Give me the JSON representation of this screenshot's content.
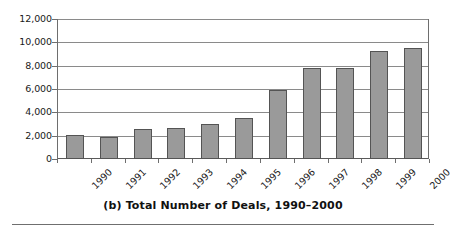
{
  "caption": "(b) Total Number of Deals, 1990–2000",
  "colors": {
    "bar_fill": "#9a9a9a",
    "bar_border": "#545454",
    "gridline": "#8a8a8a",
    "axis": "#6e6e6e",
    "text": "#1a1a1a"
  },
  "axis": {
    "y_ticks": [
      "0",
      "2,000",
      "4,000",
      "6,000",
      "8,000",
      "10,000",
      "12,000"
    ]
  },
  "chart_data": {
    "type": "bar",
    "title": "(b) Total Number of Deals, 1990–2000",
    "xlabel": "",
    "ylabel": "",
    "ylim": [
      0,
      12000
    ],
    "ytick_values": [
      0,
      2000,
      4000,
      6000,
      8000,
      10000,
      12000
    ],
    "ytick_labels": [
      "0",
      "2,000",
      "4,000",
      "6,000",
      "8,000",
      "10,000",
      "12,000"
    ],
    "grid": true,
    "legend": false,
    "categories": [
      "1990",
      "1991",
      "1992",
      "1993",
      "1994",
      "1995",
      "1996",
      "1997",
      "1998",
      "1999",
      "2000"
    ],
    "values": [
      2100,
      1850,
      2550,
      2650,
      3000,
      3500,
      5950,
      7800,
      7800,
      9300,
      9550
    ]
  }
}
